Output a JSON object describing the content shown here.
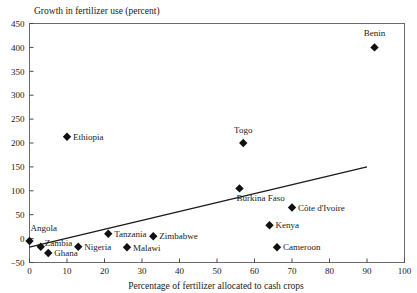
{
  "chart_data": {
    "type": "scatter",
    "title": "Growth in fertilizer use (percent)",
    "xlabel": "Percentage of fertilizer allocated to cash crops",
    "ylabel": "Growth in fertilizer use (percent)",
    "xlim": [
      0,
      100
    ],
    "ylim": [
      -50,
      450
    ],
    "xticks": [
      0,
      10,
      20,
      30,
      40,
      50,
      60,
      70,
      80,
      90,
      100
    ],
    "yticks": [
      -50,
      0,
      50,
      100,
      150,
      200,
      250,
      300,
      350,
      400,
      450
    ],
    "grid": false,
    "legend": "none",
    "marker_shape": "diamond",
    "points": [
      {
        "label": "Benin",
        "x": 92,
        "y": 400,
        "label_dx": 0,
        "label_dy": -11,
        "label_anchor": "middle"
      },
      {
        "label": "Ethiopia",
        "x": 10,
        "y": 213,
        "label_dx": 6,
        "label_dy": 3,
        "label_anchor": "start"
      },
      {
        "label": "Togo",
        "x": 57,
        "y": 200,
        "label_dx": 0,
        "label_dy": -10,
        "label_anchor": "middle"
      },
      {
        "label": "Burkina Faso",
        "x": 56,
        "y": 105,
        "label_dx": -3,
        "label_dy": 13,
        "label_anchor": "start"
      },
      {
        "label": "Côte d'Ivoire",
        "x": 70,
        "y": 65,
        "label_dx": 6,
        "label_dy": 3,
        "label_anchor": "start"
      },
      {
        "label": "Kenya",
        "x": 64,
        "y": 28,
        "label_dx": 6,
        "label_dy": 3,
        "label_anchor": "start"
      },
      {
        "label": "Tanzania",
        "x": 21,
        "y": 10,
        "label_dx": 6,
        "label_dy": 3,
        "label_anchor": "start"
      },
      {
        "label": "Zimbabwe",
        "x": 33,
        "y": 5,
        "label_dx": 6,
        "label_dy": 3,
        "label_anchor": "start"
      },
      {
        "label": "Angola",
        "x": 0,
        "y": -5,
        "label_dx": 1,
        "label_dy": -10,
        "label_anchor": "start"
      },
      {
        "label": "Zambia",
        "x": 3,
        "y": -17,
        "label_dx": 4,
        "label_dy": -1,
        "label_anchor": "start"
      },
      {
        "label": "Nigeria",
        "x": 13,
        "y": -17,
        "label_dx": 6,
        "label_dy": 3,
        "label_anchor": "start"
      },
      {
        "label": "Malawi",
        "x": 26,
        "y": -18,
        "label_dx": 6,
        "label_dy": 4,
        "label_anchor": "start"
      },
      {
        "label": "Ghana",
        "x": 5,
        "y": -30,
        "label_dx": 6,
        "label_dy": 3,
        "label_anchor": "start"
      },
      {
        "label": "Cameroon",
        "x": 66,
        "y": -18,
        "label_dx": 6,
        "label_dy": 3,
        "label_anchor": "start"
      }
    ],
    "trendline": {
      "x0": 0,
      "y0": -18,
      "x1": 90,
      "y1": 150
    }
  }
}
